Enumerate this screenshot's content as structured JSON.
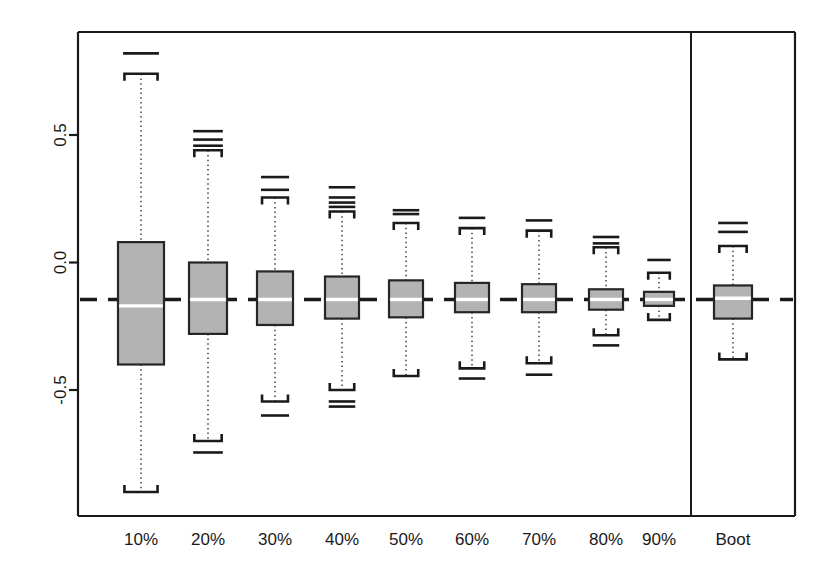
{
  "figure": {
    "background_color": "#ffffff",
    "frame_color": "#1a1a1a",
    "box_fill_color": "#b3b3b3",
    "box_border_color": "#262626",
    "median_color": "#ffffff",
    "whisker_color": "#4d4d4d",
    "outlier_color": "#1a1a1a",
    "reference_line_color": "#1a1a1a"
  },
  "chart_data": {
    "type": "boxplot",
    "title": "",
    "xlabel": "",
    "ylabel": "",
    "ylim": [
      -0.95,
      0.92
    ],
    "yticks": [
      0.5,
      0.0,
      -0.5
    ],
    "ytick_labels": [
      "0.5",
      "0.0",
      "-0.5"
    ],
    "grid": false,
    "legend": "none",
    "panel_divider_after": "90%",
    "reference_line": {
      "value": -0.145,
      "style": "dashed",
      "label": ""
    },
    "categories": [
      "10%",
      "20%",
      "30%",
      "40%",
      "50%",
      "60%",
      "70%",
      "80%",
      "90%",
      "Boot"
    ],
    "boxes": [
      {
        "category": "10%",
        "whisker_high": 0.74,
        "q3": 0.08,
        "median": -0.17,
        "q1": -0.4,
        "whisker_low": -0.9,
        "outliers_high": [
          0.82
        ],
        "outliers_low": []
      },
      {
        "category": "20%",
        "whisker_high": 0.44,
        "q3": 0.0,
        "median": -0.145,
        "q1": -0.28,
        "whisker_low": -0.7,
        "outliers_high": [
          0.515,
          0.482,
          0.458
        ],
        "outliers_low": [
          -0.745
        ]
      },
      {
        "category": "30%",
        "whisker_high": 0.255,
        "q3": -0.035,
        "median": -0.145,
        "q1": -0.245,
        "whisker_low": -0.545,
        "outliers_high": [
          0.335,
          0.285
        ],
        "outliers_low": [
          -0.6
        ]
      },
      {
        "category": "40%",
        "whisker_high": 0.2,
        "q3": -0.055,
        "median": -0.145,
        "q1": -0.22,
        "whisker_low": -0.5,
        "outliers_high": [
          0.295,
          0.255,
          0.235,
          0.218
        ],
        "outliers_low": [
          -0.545,
          -0.565
        ]
      },
      {
        "category": "50%",
        "whisker_high": 0.155,
        "q3": -0.07,
        "median": -0.145,
        "q1": -0.215,
        "whisker_low": -0.445,
        "outliers_high": [
          0.205,
          0.19
        ],
        "outliers_low": []
      },
      {
        "category": "60%",
        "whisker_high": 0.135,
        "q3": -0.08,
        "median": -0.145,
        "q1": -0.195,
        "whisker_low": -0.415,
        "outliers_high": [
          0.175
        ],
        "outliers_low": [
          -0.455
        ]
      },
      {
        "category": "70%",
        "whisker_high": 0.125,
        "q3": -0.085,
        "median": -0.145,
        "q1": -0.195,
        "whisker_low": -0.395,
        "outliers_high": [
          0.165
        ],
        "outliers_low": [
          -0.44
        ]
      },
      {
        "category": "80%",
        "whisker_high": 0.06,
        "q3": -0.105,
        "median": -0.145,
        "q1": -0.185,
        "whisker_low": -0.285,
        "outliers_high": [
          0.1,
          0.075
        ],
        "outliers_low": [
          -0.325
        ]
      },
      {
        "category": "90%",
        "whisker_high": -0.04,
        "q3": -0.115,
        "median": -0.145,
        "q1": -0.17,
        "whisker_low": -0.225,
        "outliers_high": [
          0.01
        ],
        "outliers_low": []
      },
      {
        "category": "Boot",
        "whisker_high": 0.065,
        "q3": -0.09,
        "median": -0.14,
        "q1": -0.22,
        "whisker_low": -0.38,
        "outliers_high": [
          0.155,
          0.12
        ],
        "outliers_low": []
      }
    ]
  },
  "geometry": {
    "plot_left": 78,
    "plot_right": 795,
    "plot_top": 32,
    "plot_bottom": 516,
    "divider_x": 691,
    "y_axis_pixel_map": {
      "value_0_5": 135,
      "value_0_0": 264,
      "value_neg_0_5": 390
    },
    "x_tick_label_y": 545,
    "category_centers": [
      141,
      208,
      275,
      342,
      406,
      472,
      539,
      606,
      659,
      733
    ],
    "box_widths": [
      46,
      38,
      36,
      34,
      34,
      34,
      34,
      34,
      30,
      38
    ]
  }
}
